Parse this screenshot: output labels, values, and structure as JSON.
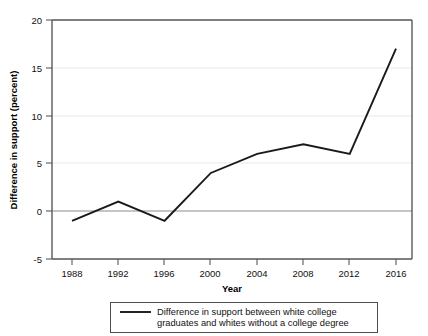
{
  "chart_data": {
    "type": "line",
    "title": "",
    "xlabel": "Year",
    "ylabel": "Difference in support (percent)",
    "x": [
      1988,
      1992,
      1996,
      2000,
      2004,
      2008,
      2012,
      2016
    ],
    "xticklabels": [
      "1988",
      "1992",
      "1996",
      "2000",
      "2004",
      "2008",
      "2012",
      "2016"
    ],
    "yticklabels": [
      "20",
      "15",
      "10",
      "5",
      "0",
      "-5"
    ],
    "yticks": [
      20,
      15,
      10,
      5,
      0,
      -5
    ],
    "ylim": [
      -5,
      20
    ],
    "xlim": [
      1986,
      2018
    ],
    "grid": "horizontal",
    "legend_position": "bottom-center",
    "series": [
      {
        "name": "Difference in support between white college graduates and whites without a college degree",
        "legend_line1": "Difference in support between white college",
        "legend_line2": "graduates and whites without a college degree",
        "color": "#1a1a1a",
        "values": [
          -1,
          1,
          -1,
          4,
          6,
          7,
          6,
          17
        ]
      }
    ]
  }
}
